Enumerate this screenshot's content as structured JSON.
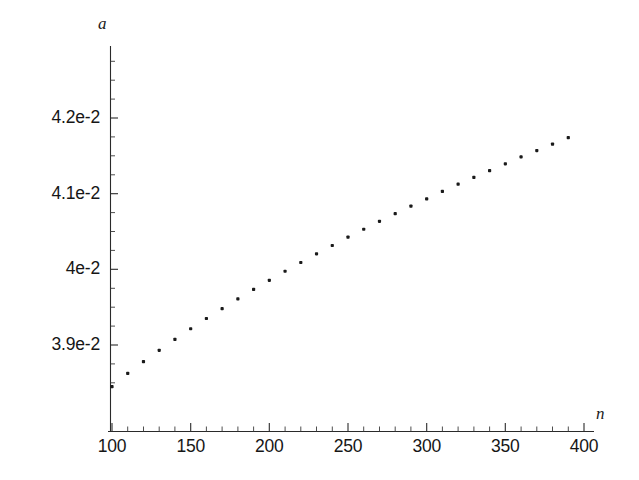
{
  "chart_data": {
    "type": "scatter",
    "title": "",
    "subtitle": "",
    "xlabel": "n",
    "ylabel": "a",
    "grid": false,
    "legend": null,
    "xlim": [
      96,
      404
    ],
    "ylim": [
      0.03825,
      0.04285
    ],
    "xticks": [
      100,
      150,
      200,
      250,
      300,
      350,
      400
    ],
    "xtick_labels": [
      "100",
      "150",
      "200",
      "250",
      "300",
      "350",
      "400"
    ],
    "xminor_step": 10,
    "yticks": [
      0.039,
      0.04,
      0.041,
      0.042
    ],
    "ytick_labels": [
      "3.9e-2",
      "4e-2",
      "4.1e-2",
      "4.2e-2"
    ],
    "yminor_step": 0.00025,
    "marker": "square-dot",
    "marker_color": "#1a1a1a",
    "marker_size": 3.2,
    "x": [
      100,
      110,
      120,
      130,
      140,
      150,
      160,
      170,
      180,
      190,
      200,
      210,
      220,
      230,
      240,
      250,
      260,
      270,
      280,
      290,
      300,
      310,
      320,
      330,
      340,
      350,
      360,
      370,
      380,
      390
    ],
    "y": [
      0.03845,
      0.038625,
      0.03878,
      0.03893,
      0.039075,
      0.039215,
      0.03935,
      0.03948,
      0.03961,
      0.039735,
      0.039855,
      0.039975,
      0.04009,
      0.040205,
      0.040315,
      0.040425,
      0.04053,
      0.040635,
      0.040735,
      0.040835,
      0.04093,
      0.04103,
      0.041125,
      0.041215,
      0.041305,
      0.041395,
      0.041485,
      0.04157,
      0.041655,
      0.04174
    ],
    "series": [
      {
        "name": "a(n)",
        "values": [
          0.03845,
          0.038625,
          0.03878,
          0.03893,
          0.039075,
          0.039215,
          0.03935,
          0.03948,
          0.03961,
          0.039735,
          0.039855,
          0.039975,
          0.04009,
          0.040205,
          0.040315,
          0.040425,
          0.04053,
          0.040635,
          0.040735,
          0.040835,
          0.04093,
          0.04103,
          0.041125,
          0.041215,
          0.041305,
          0.041395,
          0.041485,
          0.04157,
          0.041655,
          0.04174
        ]
      }
    ]
  },
  "axes": {
    "y_axis_name": "a",
    "x_axis_name": "n",
    "y_labels": [
      "4.2e-2",
      "4.1e-2",
      "4e-2",
      "3.9e-2"
    ],
    "x_labels": [
      "100",
      "150",
      "200",
      "250",
      "300",
      "350",
      "400"
    ]
  }
}
